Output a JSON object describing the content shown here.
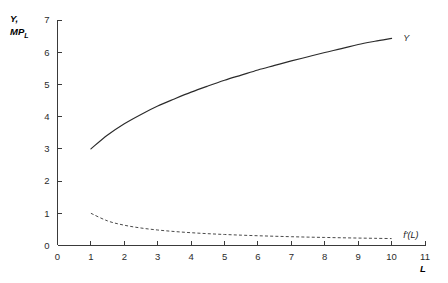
{
  "chart_data": {
    "type": "line",
    "title": "",
    "subtitle": "",
    "xlabel": "L",
    "ylabel_line1": "Y,",
    "ylabel_line2_main": "MP",
    "ylabel_line2_sub": "L",
    "xlim": [
      0,
      11
    ],
    "ylim": [
      0,
      7
    ],
    "xticks": [
      "0",
      "1",
      "2",
      "3",
      "4",
      "5",
      "6",
      "7",
      "8",
      "9",
      "10",
      "11"
    ],
    "xtick_values": [
      0,
      1,
      2,
      3,
      4,
      5,
      6,
      7,
      8,
      9,
      10,
      11
    ],
    "yticks": [
      "0",
      "1",
      "2",
      "3",
      "4",
      "5",
      "6",
      "7"
    ],
    "ytick_values": [
      0,
      1,
      2,
      3,
      4,
      5,
      6,
      7
    ],
    "grid": false,
    "legend_position": "inline-right-of-curve",
    "series": [
      {
        "name": "Y",
        "label": "Y",
        "style": "solid",
        "x": [
          1,
          1.5,
          2,
          2.5,
          3,
          3.5,
          4,
          4.5,
          5,
          5.5,
          6,
          6.5,
          7,
          7.5,
          8,
          8.5,
          9,
          9.5,
          10
        ],
        "values": [
          3.0,
          3.43,
          3.78,
          4.07,
          4.33,
          4.55,
          4.76,
          4.95,
          5.13,
          5.29,
          5.45,
          5.59,
          5.73,
          5.86,
          5.99,
          6.11,
          6.24,
          6.34,
          6.43
        ],
        "label_x": 10.35,
        "label_y": 6.45
      },
      {
        "name": "f'(L)",
        "label": "f'(L)",
        "style": "dashed",
        "x": [
          1,
          1.5,
          2,
          2.5,
          3,
          3.5,
          4,
          4.5,
          5,
          5.5,
          6,
          6.5,
          7,
          7.5,
          8,
          8.5,
          9,
          9.5,
          10
        ],
        "values": [
          1.0,
          0.763,
          0.63,
          0.543,
          0.481,
          0.434,
          0.397,
          0.367,
          0.342,
          0.321,
          0.303,
          0.287,
          0.273,
          0.26,
          0.25,
          0.24,
          0.231,
          0.223,
          0.215
        ],
        "label_x": 10.35,
        "label_y": 0.33
      }
    ],
    "colors": {
      "axis": "#3a3a3a",
      "solid_curve": "#2b2b2b",
      "dashed_curve": "#4a4a4a",
      "text": "#2b2b2b",
      "background": "#ffffff"
    }
  }
}
